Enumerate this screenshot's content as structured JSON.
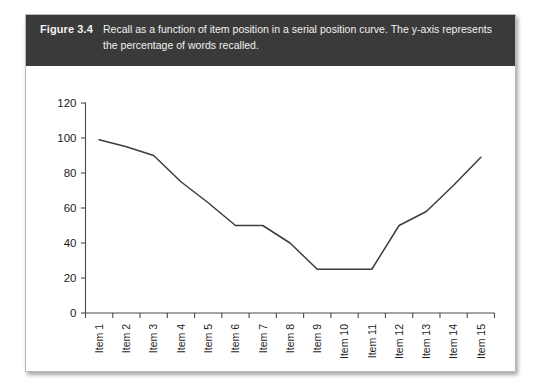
{
  "figure": {
    "label": "Figure 3.4",
    "caption": "Recall as a function of item position in a serial position curve. The y-axis represents the percentage of words recalled."
  },
  "colors": {
    "caption_bar": "#3a3a3a",
    "caption_text": "#f2f2f2",
    "card_background": "#ffffff",
    "card_border": "#b9b9b9",
    "axis": "#4a4a4a",
    "line": "#3d3d3d"
  },
  "chart_data": {
    "type": "line",
    "title": "",
    "xlabel": "",
    "ylabel": "",
    "categories": [
      "Item 1",
      "Item 2",
      "Item 3",
      "Item 4",
      "Item 5",
      "Item 6",
      "Item 7",
      "Item 8",
      "Item 9",
      "Item 10",
      "Item 11",
      "Item 12",
      "Item 13",
      "Item 14",
      "Item 15"
    ],
    "values": [
      99,
      95,
      90,
      75,
      63,
      50,
      50,
      40,
      25,
      25,
      25,
      50,
      58,
      73,
      89
    ],
    "ylim": [
      0,
      120
    ],
    "yticks": [
      0,
      20,
      40,
      60,
      80,
      100,
      120
    ],
    "ytick_labels": [
      "0",
      "20",
      "40",
      "60",
      "80",
      "100",
      "120"
    ],
    "grid": false,
    "legend": false,
    "xtick_rotation": -90
  }
}
